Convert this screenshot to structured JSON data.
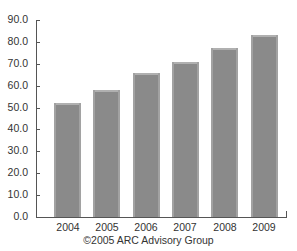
{
  "chart_data": {
    "type": "bar",
    "title": "",
    "xlabel": "",
    "ylabel": "",
    "categories": [
      "2004",
      "2005",
      "2006",
      "2007",
      "2008",
      "2009"
    ],
    "values": [
      52,
      58,
      66,
      71,
      77,
      83
    ],
    "ylim": [
      0,
      90
    ],
    "yticks": [
      "0.0",
      "10.0",
      "20.0",
      "30.0",
      "40.0",
      "50.0",
      "60.0",
      "70.0",
      "80.0",
      "90.0"
    ],
    "grid": false,
    "legend": null,
    "bar_color": "#8a8a8a",
    "source_note": "©2005 ARC Advisory Group"
  }
}
